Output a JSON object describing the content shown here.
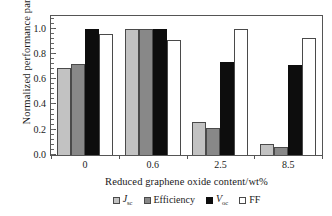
{
  "chart_data": {
    "type": "bar",
    "title": "",
    "xlabel": "Reduced graphene oxide content/wt%",
    "ylabel": "Normalized  performance parameters",
    "categories": [
      "0",
      "0.6",
      "2.5",
      "8.5"
    ],
    "ylim": [
      0.0,
      1.1
    ],
    "yticks": [
      "0.0",
      "0.2",
      "0.4",
      "0.6",
      "0.8",
      "1.0"
    ],
    "ytick_values": [
      0.0,
      0.2,
      0.4,
      0.6,
      0.8,
      1.0
    ],
    "grid": false,
    "legend_position": "below-axes",
    "frame": "box",
    "series": [
      {
        "name": "Jsc",
        "label_main": "J",
        "label_sub": "sc",
        "color": "#c2c2c2",
        "values": [
          0.69,
          1.0,
          0.265,
          0.09
        ]
      },
      {
        "name": "Efficiency",
        "label_main": "Efficiency",
        "label_sub": "",
        "color": "#888888",
        "values": [
          0.72,
          1.0,
          0.215,
          0.065
        ]
      },
      {
        "name": "Voc",
        "label_main": "V",
        "label_sub": "oc",
        "color": "#0d0d0d",
        "values": [
          1.0,
          1.0,
          0.74,
          0.71
        ]
      },
      {
        "name": "FF",
        "label_main": "FF",
        "label_sub": "",
        "color": "#ffffff",
        "values": [
          0.955,
          0.91,
          1.0,
          0.925
        ]
      }
    ]
  }
}
